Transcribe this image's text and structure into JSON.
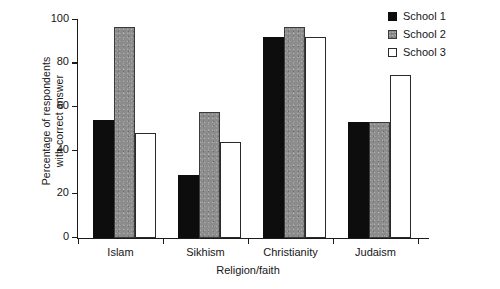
{
  "chart_data": {
    "type": "bar",
    "title": "",
    "xlabel": "Religion/faith",
    "ylabel": "Percentage of respondents\nwith correct answer",
    "categories": [
      "Islam",
      "Sikhism",
      "Christianity",
      "Judaism"
    ],
    "series": [
      {
        "name": "School 1",
        "color": "#0d0d0d",
        "fill": "solid-black",
        "values": [
          54,
          29,
          92,
          53
        ]
      },
      {
        "name": "School 2",
        "color": "#8c8c8c",
        "fill": "speckled-gray",
        "values": [
          97,
          58,
          97,
          53
        ]
      },
      {
        "name": "School 3",
        "color": "#ffffff",
        "fill": "white-outline",
        "values": [
          48,
          44,
          92,
          75
        ]
      }
    ],
    "ylim": [
      0,
      100
    ],
    "yticks": [
      0,
      20,
      40,
      60,
      80,
      100
    ],
    "ytick_labels": [
      "0",
      "20",
      "40",
      "60",
      "80",
      "100"
    ],
    "grid": false,
    "legend_position": "top-right"
  },
  "legend": {
    "entries": [
      {
        "label": "School 1"
      },
      {
        "label": "School 2"
      },
      {
        "label": "School 3"
      }
    ]
  }
}
